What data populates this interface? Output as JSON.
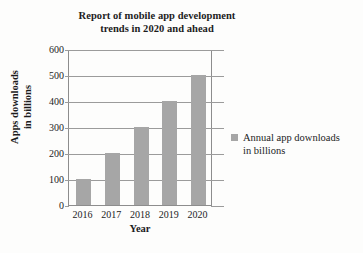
{
  "chart_data": {
    "type": "bar",
    "title": "Report of  mobile app development\ntrends in 2020 and ahead",
    "xlabel": "Year",
    "ylabel": "Apps downloads\nin  billions",
    "categories": [
      "2016",
      "2017",
      "2018",
      "2019",
      "2020"
    ],
    "values": [
      100,
      200,
      300,
      400,
      500
    ],
    "series": [
      {
        "name": "Annual app downloads\nin billions",
        "values": [
          100,
          200,
          300,
          400,
          500
        ]
      }
    ],
    "ylim": [
      0,
      600
    ],
    "yticks": [
      0,
      100,
      200,
      300,
      400,
      500,
      600
    ],
    "ytick_labels": [
      "0",
      "100",
      "200",
      "300",
      "400",
      "500",
      "600"
    ],
    "grid": "horizontal",
    "legend_position": "right",
    "legend_entries": [
      "Annual app downloads\nin billions"
    ],
    "bar_color": "#a6a6a6",
    "axis_color": "#8d8d8d",
    "grid_color": "#9b9b9b",
    "background_color": "#fdfdfc",
    "text_color": "#1c1c1c"
  }
}
